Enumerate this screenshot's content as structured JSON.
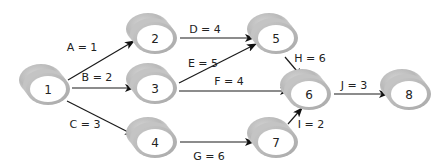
{
  "diagram": {
    "type": "activity-on-arrow network",
    "nodes": [
      {
        "id": "1",
        "label": "1",
        "cx": 48,
        "cy": 89
      },
      {
        "id": "2",
        "label": "2",
        "cx": 155,
        "cy": 38
      },
      {
        "id": "3",
        "label": "3",
        "cx": 155,
        "cy": 88
      },
      {
        "id": "4",
        "label": "4",
        "cx": 155,
        "cy": 142
      },
      {
        "id": "5",
        "label": "5",
        "cx": 276,
        "cy": 38
      },
      {
        "id": "6",
        "label": "6",
        "cx": 309,
        "cy": 94
      },
      {
        "id": "7",
        "label": "7",
        "cx": 276,
        "cy": 142
      },
      {
        "id": "8",
        "label": "8",
        "cx": 409,
        "cy": 94
      }
    ],
    "edges": [
      {
        "id": "A",
        "label": "A = 1",
        "from": "1",
        "to": "2",
        "x1": 68,
        "y1": 80,
        "x2": 134,
        "y2": 41,
        "lx": 82,
        "ly": 47
      },
      {
        "id": "B",
        "label": "B = 2",
        "from": "1",
        "to": "3",
        "x1": 72,
        "y1": 88,
        "x2": 134,
        "y2": 88,
        "lx": 97,
        "ly": 77
      },
      {
        "id": "C",
        "label": "C = 3",
        "from": "1",
        "to": "4",
        "x1": 67,
        "y1": 101,
        "x2": 134,
        "y2": 135,
        "lx": 85,
        "ly": 124
      },
      {
        "id": "D",
        "label": "D = 4",
        "from": "2",
        "to": "5",
        "x1": 180,
        "y1": 38,
        "x2": 254,
        "y2": 38,
        "lx": 205,
        "ly": 29
      },
      {
        "id": "E",
        "label": "E = 5",
        "from": "3",
        "to": "5",
        "x1": 179,
        "y1": 83,
        "x2": 256,
        "y2": 44,
        "lx": 203,
        "ly": 63
      },
      {
        "id": "F",
        "label": "F = 4",
        "from": "3",
        "to": "6",
        "x1": 179,
        "y1": 91,
        "x2": 289,
        "y2": 91,
        "lx": 229,
        "ly": 81
      },
      {
        "id": "G",
        "label": "G = 6",
        "from": "4",
        "to": "7",
        "x1": 180,
        "y1": 142,
        "x2": 254,
        "y2": 142,
        "lx": 209,
        "ly": 156
      },
      {
        "id": "H",
        "label": "H = 6",
        "from": "5",
        "to": "6",
        "x1": 285,
        "y1": 57,
        "x2": 302,
        "y2": 77,
        "lx": 310,
        "ly": 58
      },
      {
        "id": "I",
        "label": "I = 2",
        "from": "7",
        "to": "6",
        "x1": 288,
        "y1": 124,
        "x2": 302,
        "y2": 108,
        "lx": 311,
        "ly": 124
      },
      {
        "id": "J",
        "label": "J = 3",
        "from": "6",
        "to": "8",
        "x1": 334,
        "y1": 94,
        "x2": 388,
        "y2": 94,
        "lx": 354,
        "ly": 85
      }
    ]
  }
}
